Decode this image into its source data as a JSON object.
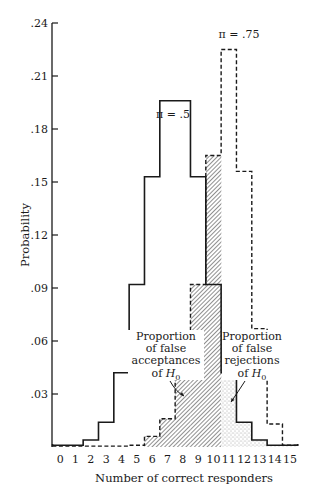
{
  "chart_data": {
    "type": "bar",
    "subtype": "step-histogram",
    "title": "",
    "xlabel": "Number of correct responders",
    "ylabel": "Probability",
    "categories": [
      "0",
      "1",
      "2",
      "3",
      "4",
      "5",
      "6",
      "7",
      "8",
      "9",
      "10",
      "11",
      "12",
      "13",
      "14",
      "15"
    ],
    "ylim": [
      0,
      0.24
    ],
    "yticks": [
      ".03",
      ".06",
      ".09",
      ".12",
      ".15",
      ".18",
      ".21",
      ".24"
    ],
    "ytick_values": [
      0.03,
      0.06,
      0.09,
      0.12,
      0.15,
      0.18,
      0.21,
      0.24
    ],
    "grid": false,
    "series": [
      {
        "name": "π = .5",
        "style": "solid",
        "values": [
          0.001,
          0.001,
          0.004,
          0.014,
          0.042,
          0.092,
          0.153,
          0.196,
          0.196,
          0.153,
          0.092,
          0.042,
          0.014,
          0.004,
          0.001,
          0.001
        ]
      },
      {
        "name": "π = .75",
        "style": "dashed",
        "values": [
          0.0,
          0.0,
          0.0,
          0.0,
          0.0,
          0.001,
          0.006,
          0.016,
          0.042,
          0.092,
          0.165,
          0.225,
          0.156,
          0.067,
          0.013,
          0.001
        ]
      }
    ],
    "shaded_regions": [
      {
        "name": "false-acceptances",
        "pattern": "hatched",
        "series": "π = .75",
        "categories": [
          "6",
          "7",
          "8",
          "9",
          "10"
        ]
      },
      {
        "name": "false-rejections",
        "pattern": "dotted",
        "series": "π = .5",
        "categories": [
          "11",
          "12",
          "13",
          "14",
          "15"
        ]
      }
    ],
    "annotations": [
      {
        "id": "pi5",
        "text": "π = .5"
      },
      {
        "id": "pi75",
        "text": "π = .75"
      },
      {
        "id": "false_acceptances",
        "lines": [
          "Proportion",
          "of false",
          "acceptances",
          "of H"
        ],
        "subscript": "0"
      },
      {
        "id": "false_rejections",
        "lines": [
          "Proportion",
          "of false",
          "rejections",
          "of H"
        ],
        "subscript": "0"
      }
    ]
  }
}
